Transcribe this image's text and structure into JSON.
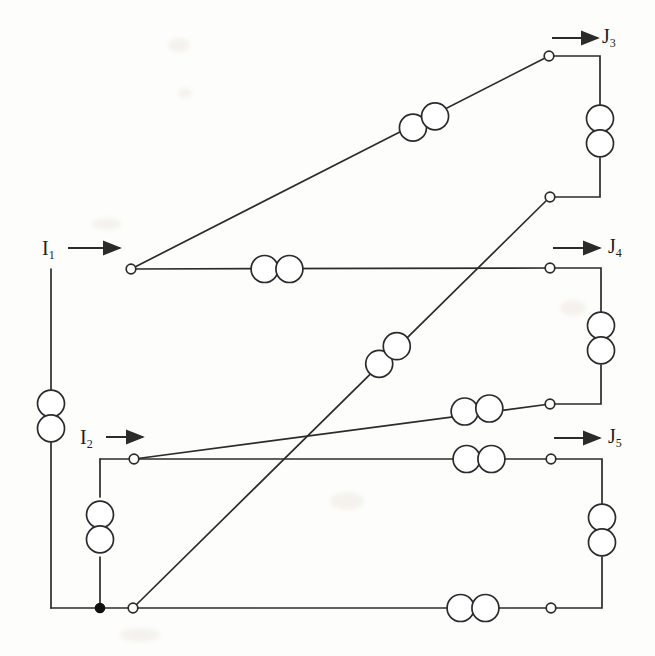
{
  "figure": {
    "type": "circuit-diagram",
    "background_color": "#fdfdfb",
    "line_color": "#2b2b2b"
  },
  "labels": [
    {
      "name": "label-I1",
      "base": "I",
      "sub": "1",
      "x": 42,
      "y": 238,
      "kind": "source-current"
    },
    {
      "name": "label-I2",
      "base": "I",
      "sub": "2",
      "x": 80,
      "y": 427,
      "kind": "source-current"
    },
    {
      "name": "label-J3",
      "base": "J",
      "sub": "3",
      "x": 602,
      "y": 26,
      "kind": "branch-current"
    },
    {
      "name": "label-J4",
      "base": "J",
      "sub": "4",
      "x": 608,
      "y": 236,
      "kind": "branch-current"
    },
    {
      "name": "label-J5",
      "base": "J",
      "sub": "5",
      "x": 608,
      "y": 426,
      "kind": "branch-current"
    }
  ],
  "arrows": [
    {
      "name": "arrow-I1",
      "x1": 68,
      "y1": 248,
      "x2": 120,
      "y2": 248
    },
    {
      "name": "arrow-I2",
      "x1": 106,
      "y1": 437,
      "x2": 143,
      "y2": 437
    },
    {
      "name": "arrow-J3",
      "x1": 552,
      "y1": 38,
      "x2": 598,
      "y2": 38
    },
    {
      "name": "arrow-J4",
      "x1": 553,
      "y1": 248,
      "x2": 600,
      "y2": 248
    },
    {
      "name": "arrow-J5",
      "x1": 554,
      "y1": 438,
      "x2": 600,
      "y2": 438
    }
  ],
  "nodes": [
    {
      "name": "node-I1-terminal",
      "x": 131,
      "y": 269,
      "type": "open"
    },
    {
      "name": "node-I2-terminal",
      "x": 134,
      "y": 459,
      "type": "open"
    },
    {
      "name": "node-J3-top",
      "x": 549,
      "y": 56,
      "type": "open"
    },
    {
      "name": "node-J3-bottom",
      "x": 550,
      "y": 197,
      "type": "open"
    },
    {
      "name": "node-J4-top",
      "x": 550,
      "y": 268,
      "type": "open"
    },
    {
      "name": "node-J4-bottom",
      "x": 550,
      "y": 404,
      "type": "open"
    },
    {
      "name": "node-J5-top",
      "x": 551,
      "y": 459,
      "type": "open"
    },
    {
      "name": "node-J5-bottom",
      "x": 551,
      "y": 608,
      "type": "open"
    },
    {
      "name": "node-bottom-left",
      "x": 133,
      "y": 608,
      "type": "open"
    },
    {
      "name": "node-junction-dot",
      "x": 100,
      "y": 608,
      "type": "filled"
    }
  ],
  "wires": [
    {
      "name": "wire-left-rail",
      "points": "51,269 51,608"
    },
    {
      "name": "wire-bottom-rail",
      "points": "51,608 133,608"
    },
    {
      "name": "wire-I1-horizontal",
      "points": "131,269 550,268"
    },
    {
      "name": "wire-I1-to-J3-diagonal",
      "points": "131,269 549,56"
    },
    {
      "name": "wire-J3-right-top",
      "points": "549,56 600,56 600,105"
    },
    {
      "name": "wire-J3-right-bottom",
      "points": "600,158 600,197 550,197"
    },
    {
      "name": "wire-J3bottom-to-origin",
      "points": "550,197 133,608"
    },
    {
      "name": "wire-J4-right-top",
      "points": "550,268 601,268 601,312"
    },
    {
      "name": "wire-J4-right-bottom",
      "points": "601,365 601,404 550,404"
    },
    {
      "name": "wire-I2-to-J4bottom",
      "points": "134,459 550,404"
    },
    {
      "name": "wire-I2-horizontal",
      "points": "134,459 551,459"
    },
    {
      "name": "wire-I2-down-stub",
      "points": "100,459 100,497"
    },
    {
      "name": "wire-I2-stub-lower",
      "points": "100,557 100,608"
    },
    {
      "name": "wire-I2-corner",
      "points": "134,459 100,459"
    },
    {
      "name": "wire-J5-right-top",
      "points": "551,459 602,459 602,504"
    },
    {
      "name": "wire-J5-right-bottom",
      "points": "602,557 602,608 551,608"
    },
    {
      "name": "wire-bottom-horizontal",
      "points": "133,608 551,608"
    }
  ],
  "coil_pairs": [
    {
      "name": "coil-left-rail",
      "orientation": "vertical",
      "cx": 51,
      "cy": 416,
      "r": 13.5,
      "on": "left-rail"
    },
    {
      "name": "coil-I1-branch",
      "orientation": "horizontal",
      "cx": 277,
      "cy": 269,
      "r": 13.5,
      "on": "I1-horizontal"
    },
    {
      "name": "coil-J3-diagonal",
      "orientation": "diagonal",
      "cx": 424,
      "cy": 122,
      "r": 13.5,
      "on": "I1-to-J3-diagonal",
      "angle": -27
    },
    {
      "name": "coil-J3-vertical",
      "orientation": "vertical",
      "cx": 600,
      "cy": 131,
      "r": 13.5,
      "on": "J3-right-rail"
    },
    {
      "name": "coil-mid-diagonal",
      "orientation": "diagonal",
      "cx": 388,
      "cy": 355,
      "r": 13.5,
      "on": "J3bottom-to-origin",
      "angle": -45
    },
    {
      "name": "coil-J4-vertical",
      "orientation": "vertical",
      "cx": 601,
      "cy": 338,
      "r": 13.5,
      "on": "J4-right-rail"
    },
    {
      "name": "coil-I2-upper-branch",
      "orientation": "horizontal",
      "cx": 477,
      "cy": 410,
      "r": 13.5,
      "on": "I2-to-J4bottom",
      "angle": -7
    },
    {
      "name": "coil-I2-branch",
      "orientation": "horizontal",
      "cx": 479,
      "cy": 459,
      "r": 13.5,
      "on": "I2-horizontal"
    },
    {
      "name": "coil-I2-stub",
      "orientation": "vertical",
      "cx": 100,
      "cy": 527,
      "r": 13.5,
      "on": "I2-down-stub"
    },
    {
      "name": "coil-J5-vertical",
      "orientation": "vertical",
      "cx": 602,
      "cy": 530,
      "r": 13.5,
      "on": "J5-right-rail"
    },
    {
      "name": "coil-bottom-branch",
      "orientation": "horizontal",
      "cx": 473,
      "cy": 608,
      "r": 13.5,
      "on": "bottom-horizontal"
    }
  ],
  "smudges": [
    {
      "x": 168,
      "y": 38,
      "w": 22,
      "h": 14
    },
    {
      "x": 178,
      "y": 88,
      "w": 14,
      "h": 10
    },
    {
      "x": 92,
      "y": 218,
      "w": 30,
      "h": 12
    },
    {
      "x": 560,
      "y": 300,
      "w": 26,
      "h": 16
    },
    {
      "x": 330,
      "y": 492,
      "w": 34,
      "h": 18
    },
    {
      "x": 120,
      "y": 628,
      "w": 40,
      "h": 14
    }
  ]
}
